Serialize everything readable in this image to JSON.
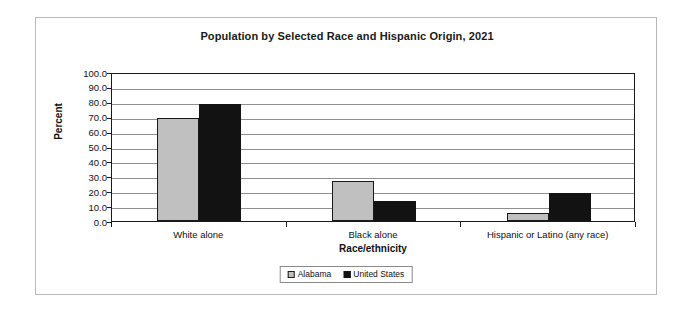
{
  "chart_data": {
    "type": "bar",
    "title": "Population by Selected Race and Hispanic Origin, 2021",
    "xlabel": "Race/ethnicity",
    "ylabel": "Percent",
    "ylim": [
      0,
      100
    ],
    "ytick_step": 10,
    "ytick_labels": [
      "100.0",
      "90.0",
      "80.0",
      "70.0",
      "60.0",
      "50.0",
      "40.0",
      "30.0",
      "20.0",
      "10.0",
      "0.0"
    ],
    "grid": true,
    "legend_position": "bottom-center",
    "categories": [
      "White alone",
      "Black alone",
      "Hispanic or Latino (any race)"
    ],
    "series": [
      {
        "name": "Alabama",
        "color": "#c0c0c0",
        "values": [
          69.0,
          27.0,
          5.3
        ]
      },
      {
        "name": "United States",
        "color": "#121212",
        "values": [
          78.8,
          13.6,
          18.9
        ]
      }
    ]
  },
  "legend": {
    "items": [
      {
        "label": "Alabama"
      },
      {
        "label": "United States"
      }
    ]
  }
}
